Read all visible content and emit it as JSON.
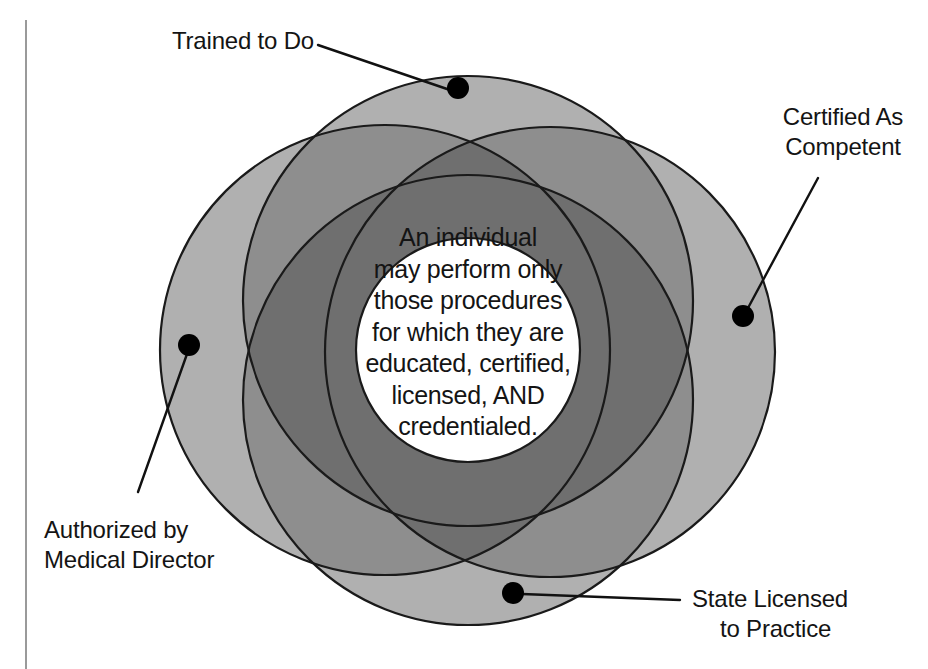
{
  "diagram": {
    "colors": {
      "petal_light": "#b0b0b0",
      "petal_mid": "#8e8e8e",
      "petal_dark": "#6f6f6f",
      "outline": "#1a1a1a",
      "center_fill": "#ffffff",
      "dot": "#000000",
      "leader_line": "#111111",
      "rule": "#9a9a9a",
      "text": "#141414"
    },
    "rule": {
      "x": 26,
      "y_top": 20,
      "y_bottom": 669
    },
    "circles": [
      {
        "id": "trained",
        "cx": 468,
        "cy": 301,
        "r": 225
      },
      {
        "id": "certified",
        "cx": 550,
        "cy": 352,
        "r": 225
      },
      {
        "id": "licensed",
        "cx": 468,
        "cy": 400,
        "r": 225
      },
      {
        "id": "authorized",
        "cx": 385,
        "cy": 350,
        "r": 225
      }
    ],
    "center_circle": {
      "cx": 468,
      "cy": 350,
      "r": 112
    }
  },
  "labels": [
    {
      "id": "trained",
      "name": "trained-to-do",
      "line1": "Trained to Do",
      "line2": "",
      "dot": {
        "cx": 458,
        "cy": 88,
        "r": 11
      },
      "leader": {
        "x1": 318,
        "y1": 45,
        "x2": 450,
        "y2": 90
      }
    },
    {
      "id": "certified",
      "name": "certified-as-competent",
      "line1": "Certified As",
      "line2": "Competent",
      "dot": {
        "cx": 743,
        "cy": 316,
        "r": 11
      },
      "leader": {
        "x1": 818,
        "y1": 178,
        "x2": 748,
        "y2": 308
      }
    },
    {
      "id": "authorized",
      "name": "authorized-by-medical-director",
      "line1": "Authorized by",
      "line2": "Medical Director",
      "dot": {
        "cx": 189,
        "cy": 345,
        "r": 11
      },
      "leader": {
        "x1": 138,
        "y1": 492,
        "x2": 187,
        "y2": 354
      }
    },
    {
      "id": "licensed",
      "name": "state-licensed-to-practice",
      "line1": "State Licensed",
      "line2": "to Practice",
      "dot": {
        "cx": 513,
        "cy": 593,
        "r": 11
      },
      "leader": {
        "x1": 680,
        "y1": 600,
        "x2": 522,
        "y2": 594
      }
    }
  ],
  "center_text": {
    "lines": [
      "An individual",
      "may perform only",
      "those procedures",
      "for which they are",
      "educated, certified,",
      "licensed, AND",
      "credentialed."
    ],
    "full": "An individual may perform only those procedures for which they are educated, certified, licensed, AND credentialed."
  },
  "chart_data": {
    "type": "venn",
    "set_labels": [
      "Trained to Do",
      "Certified As Competent",
      "State Licensed to Practice",
      "Authorized by Medical Director"
    ],
    "intersection_label": "An individual may perform only those procedures for which they are educated, certified, licensed, AND credentialed.",
    "set_count": 4,
    "legend": "none",
    "grid": false
  }
}
